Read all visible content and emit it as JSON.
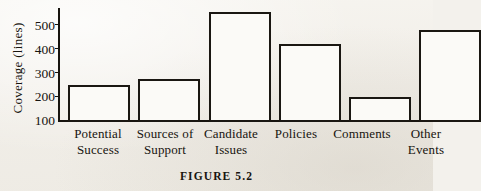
{
  "caption": "FIGURE 5.2",
  "axis": {
    "y_title": "Coverage (lines)",
    "ticks": [
      "500",
      "400",
      "300",
      "200",
      "100"
    ]
  },
  "labels": {
    "b1_l1": "Potential",
    "b1_l2": "Success",
    "b2_l1": "Sources of",
    "b2_l2": "Support",
    "b3_l1": "Candidate",
    "b3_l2": "Issues",
    "b4_l1": "Policies",
    "b4_l2": "",
    "b5_l1": "Comments",
    "b5_l2": "",
    "b6_l1": "Other",
    "b6_l2": "Events"
  },
  "chart_data": {
    "type": "bar",
    "title": "FIGURE 5.2",
    "xlabel": "",
    "ylabel": "Coverage (lines)",
    "ylim": [
      100,
      560
    ],
    "ytick_values": [
      100,
      200,
      300,
      400,
      500
    ],
    "grid": false,
    "legend": "none",
    "bar_style": {
      "fill": "#fbfaf7",
      "edge": "#1a1712",
      "edge_width_px": 2
    },
    "categories": [
      "Potential Success",
      "Sources of Support",
      "Candidate Issues",
      "Policies",
      "Comments",
      "Other Events"
    ],
    "values": [
      250,
      275,
      545,
      415,
      200,
      470
    ]
  }
}
